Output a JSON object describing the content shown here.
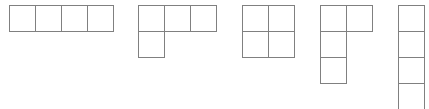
{
  "diagram": {
    "cell_size": 26,
    "line_color": "#808080",
    "background": "#ffffff",
    "shapes": [
      {
        "name": "horizontal-row-of-four",
        "origin": [
          9,
          5
        ],
        "cells": [
          [
            0,
            0
          ],
          [
            1,
            0
          ],
          [
            2,
            0
          ],
          [
            3,
            0
          ]
        ]
      },
      {
        "name": "l-shape-three-top-one-below",
        "origin": [
          138,
          5
        ],
        "cells": [
          [
            0,
            0
          ],
          [
            1,
            0
          ],
          [
            2,
            0
          ],
          [
            0,
            1
          ]
        ]
      },
      {
        "name": "two-by-two-square",
        "origin": [
          242,
          5
        ],
        "cells": [
          [
            0,
            0
          ],
          [
            1,
            0
          ],
          [
            0,
            1
          ],
          [
            1,
            1
          ]
        ]
      },
      {
        "name": "l-shape-vertical-three-with-top-right",
        "origin": [
          320,
          5
        ],
        "cells": [
          [
            0,
            0
          ],
          [
            1,
            0
          ],
          [
            0,
            1
          ],
          [
            0,
            2
          ]
        ]
      },
      {
        "name": "vertical-column-of-four",
        "origin": [
          398,
          5
        ],
        "cells": [
          [
            0,
            0
          ],
          [
            0,
            1
          ],
          [
            0,
            2
          ],
          [
            0,
            3
          ]
        ]
      }
    ]
  }
}
